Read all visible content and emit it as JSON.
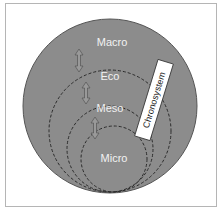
{
  "diagram": {
    "type": "nested-systems",
    "layers": [
      {
        "id": "macro",
        "label": "Macro"
      },
      {
        "id": "eco",
        "label": "Eco"
      },
      {
        "id": "meso",
        "label": "Meso"
      },
      {
        "id": "micro",
        "label": "Micro"
      }
    ],
    "chronosystem_label": "Chronosystem",
    "colors": {
      "outer_fill": "#8c8c8c",
      "outer_stroke": "#555555",
      "dash_stroke": "#2b2b2b",
      "label_text": "#f2f2f2",
      "chrono_box": "#ffffff",
      "frame_border": "#b5b5b5"
    },
    "connectors": [
      "double-arrow-icon",
      "double-arrow-icon",
      "double-arrow-icon"
    ]
  }
}
